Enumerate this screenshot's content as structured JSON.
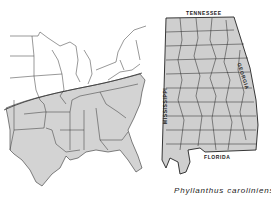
{
  "figure": {
    "caption": "Phyllanthus caroliniensis",
    "colors": {
      "range_fill": "#d3d3d3",
      "boundary_line": "#333333",
      "background": "#ffffff"
    }
  },
  "left_map": {
    "region": "Eastern United States",
    "shaded_meaning": "species range (south of boundary line)"
  },
  "right_map": {
    "region": "Alabama counties",
    "labels": {
      "north": "TENNESSEE",
      "east": "GEORGIA",
      "west": "MISSISSIPPI",
      "south": "FLORIDA"
    }
  }
}
